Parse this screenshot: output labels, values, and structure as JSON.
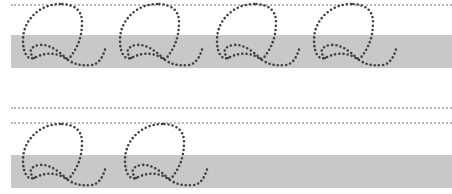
{
  "worksheet": {
    "letter": "Q",
    "colors": {
      "guide": "#b8b8b8",
      "band": "#c8c8c8",
      "stroke": "#404040",
      "background": "#ffffff"
    },
    "rows": [
      {
        "name": "row-1",
        "top_guide_y": 4,
        "band_y": 35,
        "band_height": 33,
        "glyphs": [
          {
            "x": 20
          },
          {
            "x": 117
          },
          {
            "x": 214
          },
          {
            "x": 311
          }
        ]
      },
      {
        "name": "row-2",
        "guides_y": [
          107,
          122
        ],
        "band_y": 155,
        "band_height": 33,
        "glyphs": [
          {
            "x": 20
          },
          {
            "x": 122
          }
        ]
      }
    ]
  }
}
